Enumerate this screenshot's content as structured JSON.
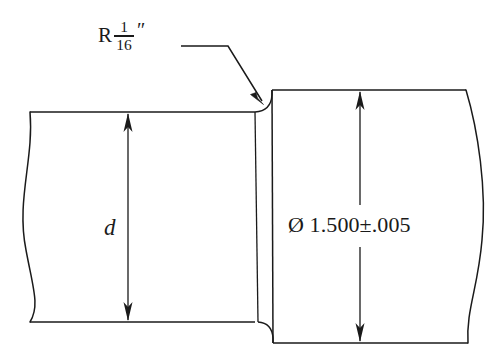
{
  "drawing": {
    "title": "Stepped shaft section with fillet radius and diameter dimensions",
    "background_color": "#ffffff",
    "line_color": "#1a1a1a",
    "text_color": "#1a1a1a",
    "annotations": {
      "radius_callout": {
        "prefix": "R",
        "fraction_numerator": "1",
        "fraction_denominator": "16",
        "unit_mark": "″",
        "full_text": "R 1/16″",
        "meaning": "fillet radius one sixteenth inch"
      },
      "small_diameter": {
        "label": "d",
        "style": "italic",
        "meaning": "undimensioned small shaft diameter"
      },
      "large_diameter": {
        "symbol": "Ø",
        "nominal": "1.500",
        "tolerance_symbol": "±",
        "tolerance": ".005",
        "full_text": "Ø 1.500±.005",
        "meaning": "large shaft diameter one point five zero zero inch plus or minus five thousandths"
      }
    },
    "features": [
      {
        "name": "left-break-line",
        "description": "wavy break line at left end of small shaft"
      },
      {
        "name": "right-break-line",
        "description": "wavy break line at right end of large shaft"
      },
      {
        "name": "shoulder-face",
        "description": "vertical step face between small and large diameters"
      },
      {
        "name": "fillet-radius",
        "description": "rounded transition at the shoulder, called out as R 1/16 inch"
      },
      {
        "name": "leader-line",
        "description": "horizontal then diagonal leader with arrowhead pointing at the fillet"
      },
      {
        "name": "small-dimension-line",
        "description": "vertical double-arrow dimension line across small shaft"
      },
      {
        "name": "large-dimension-line",
        "description": "vertical double-arrow dimension line across large shaft, broken for text"
      }
    ]
  }
}
